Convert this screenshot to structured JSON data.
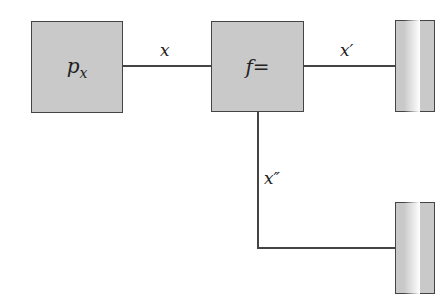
{
  "diagram": {
    "nodes": [
      {
        "id": "px",
        "label": "p",
        "subscript": "x"
      },
      {
        "id": "f",
        "label": "f="
      },
      {
        "id": "out1",
        "label": ""
      },
      {
        "id": "out2",
        "label": ""
      }
    ],
    "edges": [
      {
        "from": "px",
        "to": "f",
        "label": "x"
      },
      {
        "from": "f",
        "to": "out1",
        "label": "x′"
      },
      {
        "from": "f",
        "to": "out2",
        "label": "x″"
      }
    ]
  }
}
